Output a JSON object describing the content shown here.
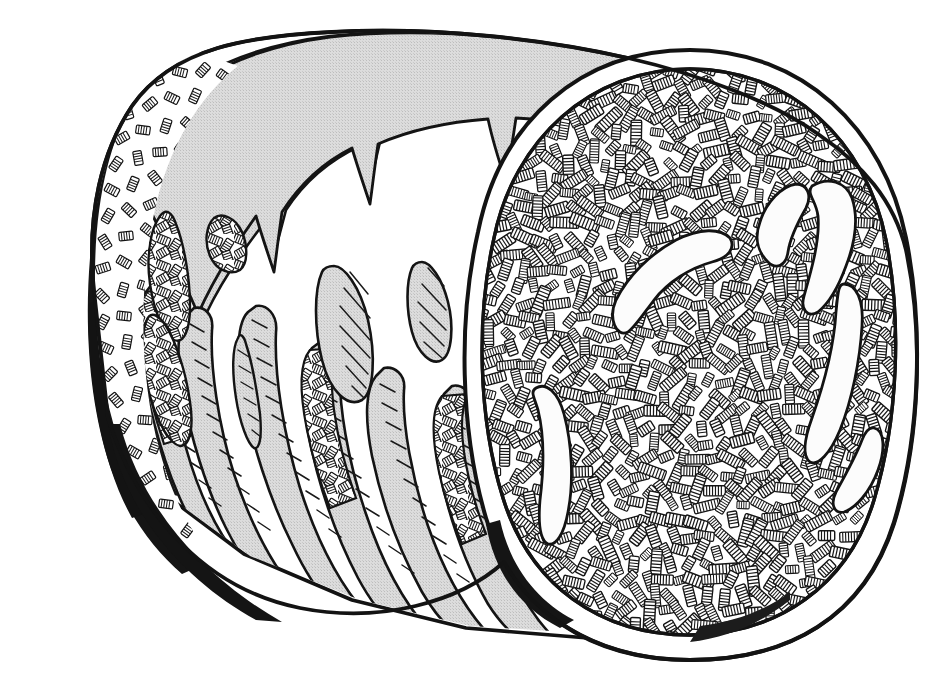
{
  "illustration": {
    "title": "Cylindrical fiber bale, cut end view",
    "subject": "round bale of chopped straw / fiber cylinder",
    "medium": "pen-and-ink line drawing",
    "technique": "cross-hatching and stipple",
    "caption": "",
    "background_color": "#ffffff",
    "ink_color": "#111111",
    "wrap_gray": "#d6d6d6",
    "wrap_gray_dark": "#c3c3c3",
    "shadow_black": "#141414",
    "void_white": "#fbfbfb",
    "canvas": {
      "width": 943,
      "height": 679
    }
  },
  "parts": {
    "body_label": "cylindrical body",
    "wrap_label": "gray outer wrap",
    "drips_label": "drip tongues",
    "face_label": "cut cross-section face",
    "rim_label": "white rim band",
    "fibers_label": "packed fiber ends",
    "voids_label": "light cavity voids",
    "patches_label": "exposed fiber patches",
    "far_edge_label": "far end hatched edge"
  },
  "geometry": {
    "body_outline": "M 95 300 C 84 214 103 150 131 108 C 172 48 250 37 330 33 C 430 28 540 40 620 56 C 700 72 770 98 812 128 L 860 170 L 880 300 L 866 470 L 820 560 L 760 600 L 700 620 L 600 634 L 470 626 L 360 600 L 250 556 L 160 490 L 110 410 Z",
    "face_center_x": 690,
    "face_center_y": 352,
    "face_rx": 205,
    "face_ry": 283,
    "rim_width": 22
  },
  "face_voids": [
    {
      "name": "void-upper-right-crescent",
      "cx": 780,
      "cy": 215,
      "len": 96,
      "w": 26,
      "rot": -62
    },
    {
      "name": "void-upper-right-hook",
      "cx": 828,
      "cy": 252,
      "len": 120,
      "w": 24,
      "rot": -70
    },
    {
      "name": "void-mid-curve",
      "cx": 672,
      "cy": 244,
      "len": 128,
      "w": 22,
      "rot": 38
    },
    {
      "name": "void-right-long",
      "cx": 845,
      "cy": 350,
      "len": 150,
      "w": 26,
      "rot": -85
    },
    {
      "name": "void-left-sickle",
      "cx": 562,
      "cy": 435,
      "len": 132,
      "w": 26,
      "rot": 72
    },
    {
      "name": "void-right-lower",
      "cx": 836,
      "cy": 470,
      "len": 90,
      "w": 22,
      "rot": -40
    }
  ],
  "wrap_blobs": [
    {
      "name": "blob-hatched-left-long",
      "cx": 163,
      "cy": 270,
      "rx": 18,
      "ry": 55,
      "rot": 8,
      "style": "woven"
    },
    {
      "name": "blob-hatched-small-oval",
      "cx": 227,
      "cy": 238,
      "rx": 17,
      "ry": 22,
      "rot": -10,
      "style": "woven"
    },
    {
      "name": "blob-gray-large-oval",
      "cx": 345,
      "cy": 310,
      "rx": 26,
      "ry": 44,
      "rot": 4,
      "style": "gray"
    },
    {
      "name": "blob-gray-small-oval",
      "cx": 429,
      "cy": 297,
      "rx": 20,
      "ry": 32,
      "rot": 6,
      "style": "gray"
    },
    {
      "name": "blob-gray-sliver",
      "cx": 244,
      "cy": 380,
      "rx": 11,
      "ry": 44,
      "rot": 6,
      "style": "gray"
    }
  ],
  "drips": [
    {
      "name": "drip-1",
      "x": 150,
      "tip_y": 300,
      "base_y": 470,
      "w": 30
    },
    {
      "name": "drip-2",
      "x": 186,
      "tip_y": 322,
      "base_y": 505,
      "w": 28
    },
    {
      "name": "drip-3",
      "x": 240,
      "tip_y": 318,
      "base_y": 540,
      "w": 30
    },
    {
      "name": "drip-4",
      "x": 300,
      "tip_y": 352,
      "base_y": 572,
      "w": 32
    },
    {
      "name": "drip-5",
      "x": 360,
      "tip_y": 380,
      "base_y": 592,
      "w": 30
    },
    {
      "name": "drip-6",
      "x": 430,
      "tip_y": 398,
      "base_y": 606,
      "w": 30
    }
  ],
  "accessibility": {
    "alt_text": "Pen and ink drawing of a cylindrical bale of chopped fiber seen from the side. The right end is a large circular cut face densely packed with short hatched fiber segments crossing in all directions, with a few pale curved voids. The cylinder body is covered by a gray wrap whose lower edge breaks into drip-like tongues, revealing the white surface beneath."
  }
}
